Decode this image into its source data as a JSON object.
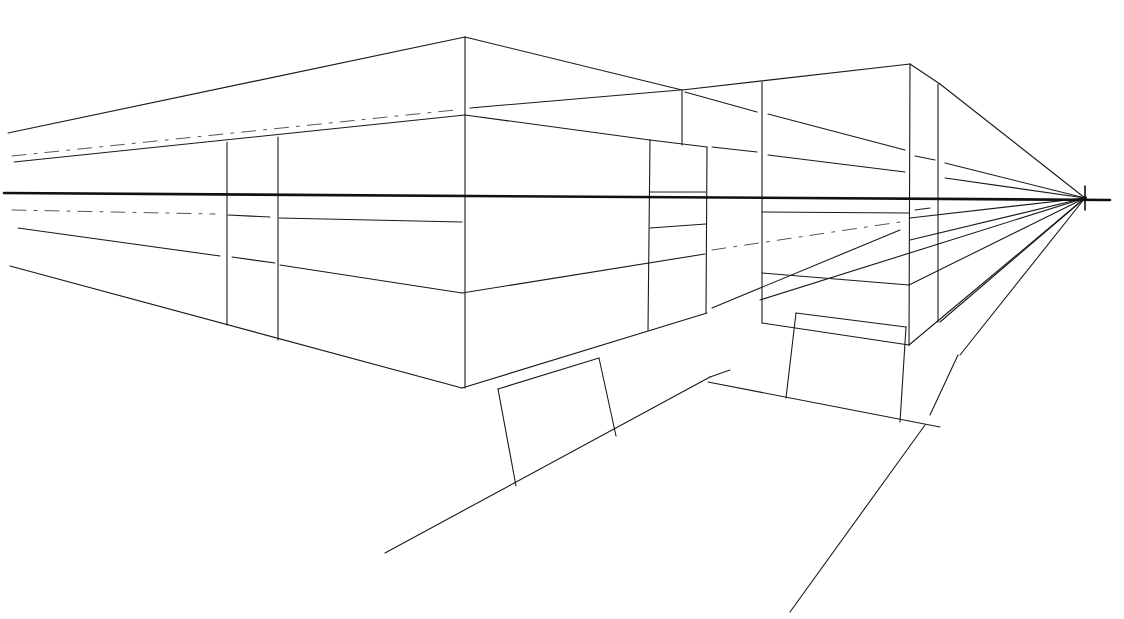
{
  "colors": {
    "ink": "#1a1a1a",
    "paper": "#ffffff"
  },
  "horizon": {
    "x1": 4,
    "y1": 193,
    "x2": 1110,
    "y2": 200
  },
  "vanishing_point": {
    "x": 1085,
    "y": 198
  },
  "lines": [
    {
      "c": "ln",
      "p": [
        8,
        133,
        465,
        37
      ]
    },
    {
      "c": "ln",
      "p": [
        465,
        37,
        682,
        90
      ]
    },
    {
      "c": "ln",
      "p": [
        14,
        162,
        465,
        115
      ]
    },
    {
      "c": "dash",
      "p": [
        12,
        156,
        455,
        110
      ]
    },
    {
      "c": "ln",
      "p": [
        470,
        108,
        680,
        90
      ]
    },
    {
      "c": "ln",
      "p": [
        465,
        37,
        465,
        388
      ]
    },
    {
      "c": "ln",
      "p": [
        465,
        115,
        650,
        140
      ]
    },
    {
      "c": "ln",
      "p": [
        650,
        140,
        707,
        147
      ]
    },
    {
      "c": "ln",
      "p": [
        10,
        266,
        462,
        388
      ]
    },
    {
      "c": "ln",
      "p": [
        18,
        228,
        220,
        256
      ]
    },
    {
      "c": "ln",
      "p": [
        232,
        257,
        275,
        263
      ]
    },
    {
      "c": "ln",
      "p": [
        280,
        265,
        462,
        293
      ]
    },
    {
      "c": "dash",
      "p": [
        12,
        210,
        215,
        214
      ]
    },
    {
      "c": "ln",
      "p": [
        228,
        215,
        270,
        217
      ]
    },
    {
      "c": "ln",
      "p": [
        279,
        218,
        462,
        222
      ]
    },
    {
      "c": "ln",
      "p": [
        227,
        142,
        227,
        325
      ]
    },
    {
      "c": "ln",
      "p": [
        278,
        137,
        278,
        340
      ]
    },
    {
      "c": "ln",
      "p": [
        462,
        293,
        705,
        254
      ]
    },
    {
      "c": "ln",
      "p": [
        462,
        388,
        707,
        313
      ]
    },
    {
      "c": "ln",
      "p": [
        650,
        140,
        648,
        330
      ]
    },
    {
      "c": "ln",
      "p": [
        707,
        147,
        706,
        313
      ]
    },
    {
      "c": "ln",
      "p": [
        650,
        192,
        706,
        192
      ]
    },
    {
      "c": "ln",
      "p": [
        650,
        228,
        706,
        224
      ]
    },
    {
      "c": "ln",
      "p": [
        682,
        90,
        910,
        64
      ]
    },
    {
      "c": "ln",
      "p": [
        682,
        90,
        682,
        145
      ]
    },
    {
      "c": "ln",
      "p": [
        762,
        82,
        762,
        323
      ]
    },
    {
      "c": "ln",
      "p": [
        910,
        64,
        909,
        345
      ]
    },
    {
      "c": "ln",
      "p": [
        910,
        64,
        940,
        84
      ]
    },
    {
      "c": "ln",
      "p": [
        940,
        84,
        1085,
        198
      ]
    },
    {
      "c": "ln",
      "p": [
        938,
        84,
        938,
        322
      ]
    },
    {
      "c": "ln",
      "p": [
        685,
        92,
        757,
        112
      ]
    },
    {
      "c": "ln",
      "p": [
        768,
        114,
        905,
        150
      ]
    },
    {
      "c": "ln",
      "p": [
        915,
        156,
        935,
        160
      ]
    },
    {
      "c": "ln",
      "p": [
        945,
        163,
        1085,
        198
      ]
    },
    {
      "c": "ln",
      "p": [
        712,
        147,
        757,
        152
      ]
    },
    {
      "c": "ln",
      "p": [
        768,
        155,
        905,
        172
      ]
    },
    {
      "c": "ln",
      "p": [
        945,
        178,
        1085,
        198
      ]
    },
    {
      "c": "ln",
      "p": [
        762,
        212,
        909,
        213
      ]
    },
    {
      "c": "ln",
      "p": [
        915,
        210,
        930,
        208
      ]
    },
    {
      "c": "dash",
      "p": [
        712,
        250,
        900,
        222
      ]
    },
    {
      "c": "ln",
      "p": [
        910,
        218,
        1085,
        198
      ]
    },
    {
      "c": "ln",
      "p": [
        712,
        308,
        900,
        230
      ]
    },
    {
      "c": "ln",
      "p": [
        910,
        240,
        1085,
        198
      ]
    },
    {
      "c": "ln",
      "p": [
        762,
        273,
        909,
        285
      ]
    },
    {
      "c": "ln",
      "p": [
        909,
        285,
        1085,
        198
      ]
    },
    {
      "c": "ln",
      "p": [
        762,
        323,
        909,
        345
      ]
    },
    {
      "c": "ln",
      "p": [
        909,
        345,
        1085,
        198
      ]
    },
    {
      "c": "ln",
      "p": [
        940,
        322,
        1085,
        198
      ]
    },
    {
      "c": "ln",
      "p": [
        960,
        355,
        1085,
        198
      ]
    },
    {
      "c": "ln",
      "p": [
        930,
        415,
        958,
        355
      ]
    },
    {
      "c": "ln",
      "p": [
        790,
        612,
        925,
        425
      ]
    },
    {
      "c": "ln",
      "p": [
        385,
        553,
        710,
        377
      ]
    },
    {
      "c": "ln",
      "p": [
        710,
        377,
        730,
        370
      ]
    },
    {
      "c": "ln",
      "p": [
        708,
        382,
        940,
        427
      ]
    },
    {
      "c": "ln",
      "p": [
        498,
        389,
        516,
        486
      ]
    },
    {
      "c": "ln",
      "p": [
        498,
        389,
        599,
        358
      ]
    },
    {
      "c": "ln",
      "p": [
        599,
        358,
        616,
        436
      ]
    },
    {
      "c": "ln",
      "p": [
        796,
        313,
        906,
        327
      ]
    },
    {
      "c": "ln",
      "p": [
        796,
        313,
        786,
        398
      ]
    },
    {
      "c": "ln",
      "p": [
        906,
        327,
        900,
        422
      ]
    },
    {
      "c": "ln",
      "p": [
        760,
        300,
        1085,
        198
      ]
    },
    {
      "c": "vp",
      "p": [
        1085,
        186,
        1085,
        210
      ]
    }
  ]
}
